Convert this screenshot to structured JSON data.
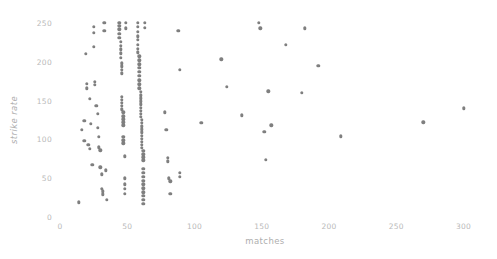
{
  "chart_data": {
    "type": "scatter",
    "title": "",
    "xlabel": "matches",
    "ylabel": "strike rate",
    "xlim": [
      0,
      310
    ],
    "ylim": [
      0,
      262
    ],
    "grid": false,
    "legend": null,
    "marker_color": "#7f7f7f",
    "xticks": [
      0,
      50,
      100,
      150,
      200,
      250,
      300
    ],
    "xticklabels": [
      "0",
      "50",
      "100",
      "150",
      "200",
      "250",
      "300"
    ],
    "yticks": [
      0,
      50,
      100,
      150,
      200,
      250
    ],
    "yticklabels": [
      "0",
      "50",
      "100",
      "150",
      "200",
      "250"
    ],
    "series_name": "players",
    "points": [
      [
        14,
        19
      ],
      [
        16,
        112
      ],
      [
        18,
        124
      ],
      [
        18,
        98
      ],
      [
        19,
        210
      ],
      [
        20,
        172
      ],
      [
        20,
        166
      ],
      [
        21,
        93
      ],
      [
        22,
        152
      ],
      [
        22,
        88
      ],
      [
        23,
        120
      ],
      [
        24,
        67
      ],
      [
        25,
        245
      ],
      [
        25,
        237
      ],
      [
        25,
        219
      ],
      [
        26,
        174
      ],
      [
        26,
        170
      ],
      [
        27,
        143
      ],
      [
        28,
        133
      ],
      [
        28,
        115
      ],
      [
        29,
        103
      ],
      [
        29,
        90
      ],
      [
        30,
        86
      ],
      [
        30,
        64
      ],
      [
        31,
        55
      ],
      [
        31,
        36
      ],
      [
        32,
        33
      ],
      [
        32,
        29
      ],
      [
        33,
        250
      ],
      [
        33,
        240
      ],
      [
        34,
        60
      ],
      [
        35,
        22
      ],
      [
        44,
        250
      ],
      [
        44,
        246
      ],
      [
        44,
        242
      ],
      [
        44,
        236
      ],
      [
        44,
        231
      ],
      [
        45,
        226
      ],
      [
        45,
        221
      ],
      [
        45,
        216
      ],
      [
        45,
        211
      ],
      [
        45,
        205
      ],
      [
        46,
        198
      ],
      [
        46,
        194
      ],
      [
        46,
        190
      ],
      [
        46,
        185
      ],
      [
        46,
        155
      ],
      [
        46,
        151
      ],
      [
        46,
        147
      ],
      [
        46,
        143
      ],
      [
        46,
        139
      ],
      [
        47,
        135
      ],
      [
        47,
        130
      ],
      [
        47,
        126
      ],
      [
        47,
        122
      ],
      [
        47,
        118
      ],
      [
        47,
        103
      ],
      [
        47,
        99
      ],
      [
        47,
        95
      ],
      [
        48,
        78
      ],
      [
        48,
        50
      ],
      [
        48,
        42
      ],
      [
        48,
        36
      ],
      [
        48,
        30
      ],
      [
        49,
        250
      ],
      [
        49,
        243
      ],
      [
        58,
        250
      ],
      [
        58,
        245
      ],
      [
        58,
        239
      ],
      [
        58,
        233
      ],
      [
        58,
        228
      ],
      [
        58,
        222
      ],
      [
        58,
        217
      ],
      [
        58,
        212
      ],
      [
        59,
        207
      ],
      [
        59,
        202
      ],
      [
        59,
        197
      ],
      [
        59,
        192
      ],
      [
        59,
        187
      ],
      [
        59,
        182
      ],
      [
        59,
        176
      ],
      [
        59,
        171
      ],
      [
        59,
        166
      ],
      [
        60,
        161
      ],
      [
        60,
        157
      ],
      [
        60,
        153
      ],
      [
        60,
        149
      ],
      [
        60,
        145
      ],
      [
        60,
        141
      ],
      [
        60,
        137
      ],
      [
        60,
        133
      ],
      [
        60,
        129
      ],
      [
        61,
        125
      ],
      [
        61,
        121
      ],
      [
        61,
        117
      ],
      [
        61,
        113
      ],
      [
        61,
        109
      ],
      [
        61,
        105
      ],
      [
        61,
        101
      ],
      [
        61,
        97
      ],
      [
        61,
        93
      ],
      [
        61,
        89
      ],
      [
        62,
        85
      ],
      [
        62,
        81
      ],
      [
        62,
        77
      ],
      [
        62,
        73
      ],
      [
        62,
        62
      ],
      [
        62,
        57
      ],
      [
        62,
        52
      ],
      [
        62,
        47
      ],
      [
        62,
        42
      ],
      [
        62,
        37
      ],
      [
        62,
        32
      ],
      [
        62,
        27
      ],
      [
        62,
        22
      ],
      [
        62,
        17
      ],
      [
        63,
        250
      ],
      [
        63,
        244
      ],
      [
        78,
        135
      ],
      [
        79,
        112
      ],
      [
        80,
        76
      ],
      [
        80,
        72
      ],
      [
        81,
        50
      ],
      [
        82,
        46
      ],
      [
        82,
        30
      ],
      [
        88,
        240
      ],
      [
        89,
        190
      ],
      [
        89,
        57
      ],
      [
        89,
        52
      ],
      [
        105,
        121
      ],
      [
        120,
        203
      ],
      [
        124,
        168
      ],
      [
        135,
        131
      ],
      [
        148,
        250
      ],
      [
        149,
        243
      ],
      [
        152,
        110
      ],
      [
        153,
        74
      ],
      [
        155,
        162
      ],
      [
        157,
        118
      ],
      [
        168,
        222
      ],
      [
        180,
        160
      ],
      [
        182,
        243
      ],
      [
        192,
        195
      ],
      [
        209,
        104
      ],
      [
        270,
        122
      ],
      [
        300,
        140
      ]
    ]
  }
}
